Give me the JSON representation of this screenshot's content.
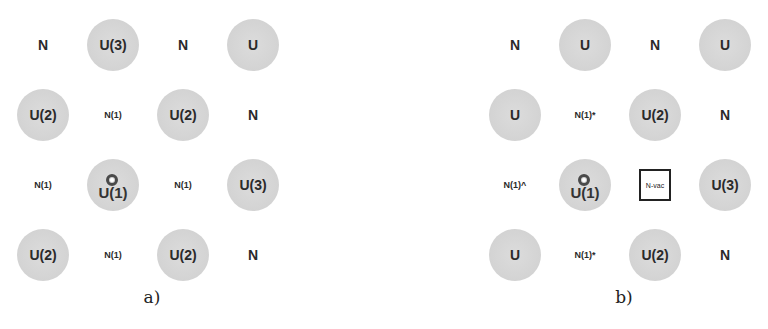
{
  "panels": [
    {
      "caption": "a)",
      "grid": [
        [
          "N",
          "U(3)",
          "N",
          "U"
        ],
        [
          "U(2)",
          "N(1)",
          "U(2)",
          "N"
        ],
        [
          "N(1)",
          "U(1)",
          "N(1)",
          "U(3)"
        ],
        [
          "U(2)",
          "N(1)",
          "U(2)",
          "N"
        ]
      ]
    },
    {
      "caption": "b)",
      "grid": [
        [
          "N",
          "U",
          "N",
          "U"
        ],
        [
          "U",
          "N(1)*",
          "U(2)",
          "N"
        ],
        [
          "N(1)^",
          "U(1)",
          "N-vac",
          "U(3)"
        ],
        [
          "U",
          "N(1)*",
          "U(2)",
          "N"
        ]
      ]
    }
  ],
  "legend": {
    "u_atom": "U (grey circle)",
    "n_atom": "N (plain text)",
    "vacancy": "N-vac (boxed)",
    "defect_marker": "ring on U(1)"
  },
  "colors": {
    "u_circle": "#d3d3d3",
    "text": "#2a2a2a",
    "vacancy_border": "#222222"
  }
}
